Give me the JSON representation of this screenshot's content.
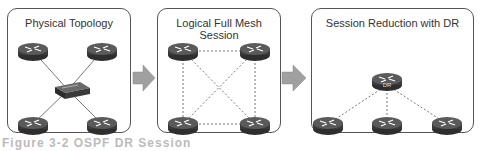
{
  "panels": [
    {
      "title": "Physical Topology",
      "x": 7,
      "y": 8,
      "w": 124,
      "h": 125
    },
    {
      "title": "Logical Full Mesh Session",
      "x": 157,
      "y": 8,
      "w": 124,
      "h": 125
    },
    {
      "title": "Session Reduction with DR",
      "x": 311,
      "y": 8,
      "w": 163,
      "h": 125
    }
  ],
  "dr_label": "DR",
  "caption": "Figure 3-2  OSPF DR Session",
  "colors": {
    "router": "#3a3a3a",
    "arrow": "#a0a0a0",
    "border": "#555555"
  }
}
